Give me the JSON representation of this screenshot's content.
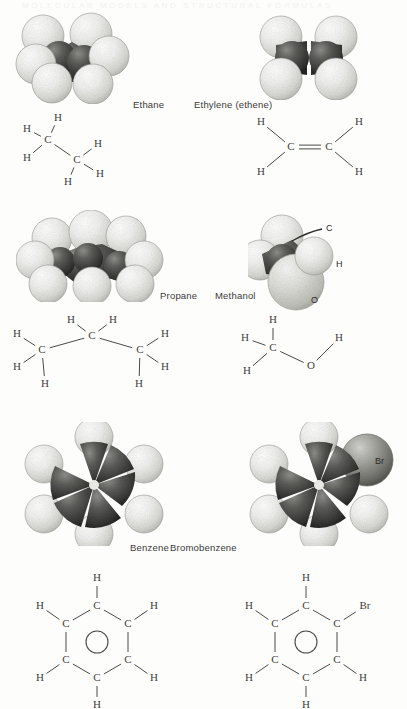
{
  "figure": {
    "ghost_text": "MOLECULAR MODELS AND STRUCTURAL FORMULAS",
    "background_color": "#fdfdfc",
    "ink_color": "#3d3d3d"
  },
  "molecules": [
    {
      "id": "ethane",
      "name": "Ethane",
      "model_type": "space-filling",
      "carbon_count": 2,
      "hydrogen_count": 6,
      "model_callouts": [],
      "formula": {
        "atoms": [
          {
            "label": "H",
            "x": 13,
            "y": 17
          },
          {
            "label": "H",
            "x": 44,
            "y": 6
          },
          {
            "label": "C",
            "x": 34,
            "y": 28
          },
          {
            "label": "H",
            "x": 13,
            "y": 46
          },
          {
            "label": "C",
            "x": 63,
            "y": 48
          },
          {
            "label": "H",
            "x": 54,
            "y": 70
          },
          {
            "label": "H",
            "x": 84,
            "y": 32
          },
          {
            "label": "H",
            "x": 86,
            "y": 62
          }
        ],
        "bonds": [
          {
            "from": 0,
            "to": 2,
            "order": 1
          },
          {
            "from": 1,
            "to": 2,
            "order": 1
          },
          {
            "from": 3,
            "to": 2,
            "order": 1
          },
          {
            "from": 2,
            "to": 4,
            "order": 1
          },
          {
            "from": 4,
            "to": 5,
            "order": 1
          },
          {
            "from": 4,
            "to": 6,
            "order": 1
          },
          {
            "from": 4,
            "to": 7,
            "order": 1
          }
        ],
        "ring": null
      }
    },
    {
      "id": "ethylene",
      "name": "Ethylene (ethene)",
      "model_type": "space-filling",
      "carbon_count": 2,
      "hydrogen_count": 4,
      "model_callouts": [],
      "formula": {
        "atoms": [
          {
            "label": "H",
            "x": 10,
            "y": 8
          },
          {
            "label": "H",
            "x": 10,
            "y": 58
          },
          {
            "label": "C",
            "x": 40,
            "y": 33
          },
          {
            "label": "C",
            "x": 78,
            "y": 33
          },
          {
            "label": "H",
            "x": 108,
            "y": 8
          },
          {
            "label": "H",
            "x": 108,
            "y": 58
          }
        ],
        "bonds": [
          {
            "from": 0,
            "to": 2,
            "order": 1
          },
          {
            "from": 1,
            "to": 2,
            "order": 1
          },
          {
            "from": 2,
            "to": 3,
            "order": 2
          },
          {
            "from": 3,
            "to": 4,
            "order": 1
          },
          {
            "from": 3,
            "to": 5,
            "order": 1
          }
        ],
        "ring": null
      }
    },
    {
      "id": "propane",
      "name": "Propane",
      "model_type": "space-filling",
      "carbon_count": 3,
      "hydrogen_count": 8,
      "model_callouts": [],
      "formula": {
        "atoms": [
          {
            "label": "H",
            "x": 8,
            "y": 22
          },
          {
            "label": "C",
            "x": 33,
            "y": 38
          },
          {
            "label": "H",
            "x": 8,
            "y": 55
          },
          {
            "label": "H",
            "x": 36,
            "y": 72
          },
          {
            "label": "H",
            "x": 62,
            "y": 8
          },
          {
            "label": "C",
            "x": 83,
            "y": 24
          },
          {
            "label": "H",
            "x": 104,
            "y": 8
          },
          {
            "label": "C",
            "x": 131,
            "y": 38
          },
          {
            "label": "H",
            "x": 156,
            "y": 22
          },
          {
            "label": "H",
            "x": 156,
            "y": 55
          },
          {
            "label": "H",
            "x": 130,
            "y": 72
          }
        ],
        "bonds": [
          {
            "from": 0,
            "to": 1,
            "order": 1
          },
          {
            "from": 2,
            "to": 1,
            "order": 1
          },
          {
            "from": 3,
            "to": 1,
            "order": 1
          },
          {
            "from": 1,
            "to": 5,
            "order": 1
          },
          {
            "from": 4,
            "to": 5,
            "order": 1
          },
          {
            "from": 6,
            "to": 5,
            "order": 1
          },
          {
            "from": 5,
            "to": 7,
            "order": 1
          },
          {
            "from": 7,
            "to": 8,
            "order": 1
          },
          {
            "from": 7,
            "to": 9,
            "order": 1
          },
          {
            "from": 7,
            "to": 10,
            "order": 1
          }
        ],
        "ring": null
      }
    },
    {
      "id": "methanol",
      "name": "Methanol",
      "model_type": "space-filling",
      "carbon_count": 1,
      "hydrogen_count": 4,
      "model_callouts": [
        {
          "label": "C",
          "x": 78,
          "y": 16
        },
        {
          "label": "H",
          "x": 88,
          "y": 52
        },
        {
          "label": "O",
          "x": 63,
          "y": 88
        }
      ],
      "formula": {
        "atoms": [
          {
            "label": "H",
            "x": 38,
            "y": 6
          },
          {
            "label": "H",
            "x": 10,
            "y": 24
          },
          {
            "label": "C",
            "x": 38,
            "y": 34
          },
          {
            "label": "H",
            "x": 12,
            "y": 57
          },
          {
            "label": "O",
            "x": 76,
            "y": 52
          },
          {
            "label": "H",
            "x": 104,
            "y": 24
          }
        ],
        "bonds": [
          {
            "from": 0,
            "to": 2,
            "order": 1
          },
          {
            "from": 1,
            "to": 2,
            "order": 1
          },
          {
            "from": 3,
            "to": 2,
            "order": 1
          },
          {
            "from": 2,
            "to": 4,
            "order": 1
          },
          {
            "from": 4,
            "to": 5,
            "order": 1
          }
        ],
        "ring": null
      }
    },
    {
      "id": "benzene",
      "name": "Benzene",
      "model_type": "space-filling",
      "carbon_count": 6,
      "hydrogen_count": 6,
      "model_callouts": [],
      "formula": {
        "atoms": [
          {
            "label": "C",
            "x": 59,
            "y": 32
          },
          {
            "label": "C",
            "x": 90,
            "y": 50
          },
          {
            "label": "C",
            "x": 90,
            "y": 86
          },
          {
            "label": "C",
            "x": 59,
            "y": 104
          },
          {
            "label": "C",
            "x": 28,
            "y": 86
          },
          {
            "label": "C",
            "x": 28,
            "y": 50
          },
          {
            "label": "H",
            "x": 59,
            "y": 4
          },
          {
            "label": "H",
            "x": 116,
            "y": 32
          },
          {
            "label": "H",
            "x": 116,
            "y": 104
          },
          {
            "label": "H",
            "x": 59,
            "y": 131
          },
          {
            "label": "H",
            "x": 2,
            "y": 104
          },
          {
            "label": "H",
            "x": 2,
            "y": 32
          }
        ],
        "bonds": [
          {
            "from": 0,
            "to": 1,
            "order": 1
          },
          {
            "from": 1,
            "to": 2,
            "order": 1
          },
          {
            "from": 2,
            "to": 3,
            "order": 1
          },
          {
            "from": 3,
            "to": 4,
            "order": 1
          },
          {
            "from": 4,
            "to": 5,
            "order": 1
          },
          {
            "from": 5,
            "to": 0,
            "order": 1
          },
          {
            "from": 0,
            "to": 6,
            "order": 1
          },
          {
            "from": 1,
            "to": 7,
            "order": 1
          },
          {
            "from": 2,
            "to": 8,
            "order": 1
          },
          {
            "from": 3,
            "to": 9,
            "order": 1
          },
          {
            "from": 4,
            "to": 10,
            "order": 1
          },
          {
            "from": 5,
            "to": 11,
            "order": 1
          }
        ],
        "ring": {
          "cx": 59,
          "cy": 68,
          "r": 11
        }
      }
    },
    {
      "id": "bromobenzene",
      "name": "Bromobenzene",
      "model_type": "space-filling",
      "carbon_count": 6,
      "hydrogen_count": 5,
      "model_callouts": [
        {
          "label": "Br",
          "x": 96,
          "y": 22
        }
      ],
      "formula": {
        "atoms": [
          {
            "label": "C",
            "x": 59,
            "y": 32
          },
          {
            "label": "C",
            "x": 90,
            "y": 50
          },
          {
            "label": "C",
            "x": 90,
            "y": 86
          },
          {
            "label": "C",
            "x": 59,
            "y": 104
          },
          {
            "label": "C",
            "x": 28,
            "y": 86
          },
          {
            "label": "C",
            "x": 28,
            "y": 50
          },
          {
            "label": "H",
            "x": 59,
            "y": 4
          },
          {
            "label": "Br",
            "x": 118,
            "y": 32
          },
          {
            "label": "H",
            "x": 116,
            "y": 104
          },
          {
            "label": "H",
            "x": 59,
            "y": 131
          },
          {
            "label": "H",
            "x": 2,
            "y": 104
          },
          {
            "label": "H",
            "x": 2,
            "y": 32
          }
        ],
        "bonds": [
          {
            "from": 0,
            "to": 1,
            "order": 1
          },
          {
            "from": 1,
            "to": 2,
            "order": 1
          },
          {
            "from": 2,
            "to": 3,
            "order": 1
          },
          {
            "from": 3,
            "to": 4,
            "order": 1
          },
          {
            "from": 4,
            "to": 5,
            "order": 1
          },
          {
            "from": 5,
            "to": 0,
            "order": 1
          },
          {
            "from": 0,
            "to": 6,
            "order": 1
          },
          {
            "from": 1,
            "to": 7,
            "order": 1
          },
          {
            "from": 2,
            "to": 8,
            "order": 1
          },
          {
            "from": 3,
            "to": 9,
            "order": 1
          },
          {
            "from": 4,
            "to": 10,
            "order": 1
          },
          {
            "from": 5,
            "to": 11,
            "order": 1
          }
        ],
        "ring": {
          "cx": 59,
          "cy": 68,
          "r": 11
        }
      }
    }
  ]
}
